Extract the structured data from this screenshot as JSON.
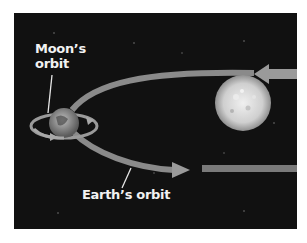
{
  "diagram": {
    "labels": {
      "moon_orbit": "Moon's orbit",
      "moon_orbit_line1": "Moon’s",
      "moon_orbit_line2": "orbit",
      "earth_orbit": "Earth’s orbit"
    },
    "objects": [
      {
        "name": "Sun",
        "icon": "sun-icon"
      },
      {
        "name": "Earth",
        "icon": "earth-icon"
      }
    ],
    "colors": {
      "background": "#111111",
      "orbit_arrow": "#8a8a8a",
      "label_text": "#f2f2f2",
      "sun": "#d9d9d9"
    }
  }
}
